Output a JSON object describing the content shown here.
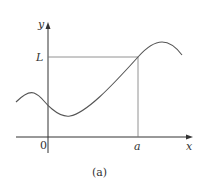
{
  "figure": {
    "caption": "(a)",
    "labels": {
      "y_axis": "y",
      "x_axis": "x",
      "origin": "0",
      "limit_value": "L",
      "point_a": "a"
    },
    "colors": {
      "axis": "#333333",
      "curve": "#555555",
      "guide_lines": "#777777"
    }
  }
}
